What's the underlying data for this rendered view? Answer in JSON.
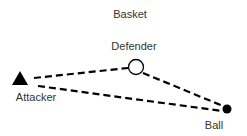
{
  "diagram": {
    "labels": {
      "basket": "Basket",
      "defender": "Defender",
      "attacker": "Attacker",
      "ball": "Ball"
    },
    "nodes": [
      {
        "id": "attacker",
        "shape": "triangle",
        "fill": "#000000",
        "cx": 20,
        "cy": 78
      },
      {
        "id": "defender",
        "shape": "circle-outline",
        "fill": "#ffffff",
        "stroke": "#000000",
        "cx": 136,
        "cy": 67,
        "r": 8
      },
      {
        "id": "ball",
        "shape": "circle-filled",
        "fill": "#000000",
        "cx": 227,
        "cy": 109,
        "r": 4
      }
    ],
    "edges": [
      {
        "from": "attacker",
        "to": "defender",
        "style": "dashed"
      },
      {
        "from": "defender",
        "to": "ball",
        "style": "dashed"
      },
      {
        "from": "attacker",
        "to": "ball",
        "style": "dashed"
      }
    ],
    "colors": {
      "line": "#000000",
      "text": "#333333",
      "background": "#ffffff"
    }
  }
}
